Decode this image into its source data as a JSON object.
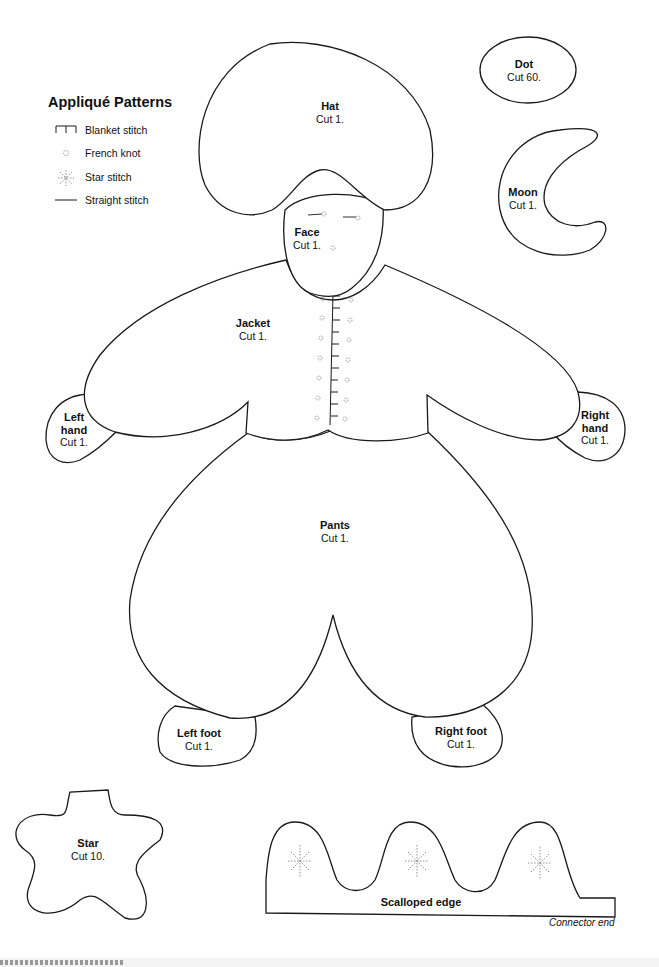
{
  "legend": {
    "title": "Appliqué Patterns",
    "items": [
      {
        "icon": "blanket-stitch-icon",
        "label": "Blanket stitch"
      },
      {
        "icon": "french-knot-icon",
        "label": "French knot"
      },
      {
        "icon": "star-stitch-icon",
        "label": "Star stitch"
      },
      {
        "icon": "straight-stitch-icon",
        "label": "Straight stitch"
      }
    ]
  },
  "pieces": {
    "hat": {
      "name": "Hat",
      "cut": "Cut 1."
    },
    "face": {
      "name": "Face",
      "cut": "Cut 1."
    },
    "dot": {
      "name": "Dot",
      "cut": "Cut 60."
    },
    "moon": {
      "name": "Moon",
      "cut": "Cut 1."
    },
    "jacket": {
      "name": "Jacket",
      "cut": "Cut 1."
    },
    "left_hand": {
      "name1": "Left",
      "name2": "hand",
      "cut": "Cut 1."
    },
    "right_hand": {
      "name1": "Right",
      "name2": "hand",
      "cut": "Cut 1."
    },
    "pants": {
      "name": "Pants",
      "cut": "Cut 1."
    },
    "left_foot": {
      "name": "Left foot",
      "cut": "Cut 1."
    },
    "right_foot": {
      "name": "Right foot",
      "cut": "Cut 1."
    },
    "star": {
      "name": "Star",
      "cut": "Cut 10."
    },
    "scalloped_edge": {
      "name": "Scalloped edge",
      "note": "Connector end"
    }
  }
}
